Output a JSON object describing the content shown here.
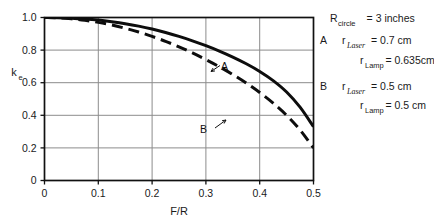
{
  "chart_data": {
    "type": "line",
    "title": "",
    "xlabel": "F/R",
    "ylabel": "k_e",
    "ylabel_base": "k",
    "ylabel_sub": "e",
    "xlim": [
      0,
      0.5
    ],
    "ylim": [
      0,
      1.0
    ],
    "grid": true,
    "xticks": [
      "0",
      "0.1",
      "0.2",
      "0.3",
      "0.4",
      "0.5"
    ],
    "xtick_values": [
      0,
      0.1,
      0.2,
      0.3,
      0.4,
      0.5
    ],
    "yticks": [
      "0",
      "0.2",
      "0.4",
      "0.6",
      "0.8",
      "1.0"
    ],
    "ytick_values": [
      0,
      0.2,
      0.4,
      0.6,
      0.8,
      1.0
    ],
    "legend_position": "right-outside",
    "series": [
      {
        "name": "A",
        "style": "solid",
        "annotation": "A",
        "x": [
          0.0,
          0.025,
          0.05,
          0.075,
          0.1,
          0.125,
          0.15,
          0.175,
          0.2,
          0.225,
          0.25,
          0.275,
          0.3,
          0.325,
          0.35,
          0.375,
          0.4,
          0.425,
          0.45,
          0.475,
          0.5
        ],
        "values": [
          1.0,
          0.999,
          0.996,
          0.991,
          0.984,
          0.974,
          0.962,
          0.947,
          0.929,
          0.908,
          0.884,
          0.857,
          0.827,
          0.794,
          0.757,
          0.716,
          0.669,
          0.613,
          0.543,
          0.45,
          0.33
        ]
      },
      {
        "name": "B",
        "style": "dashed",
        "annotation": "B",
        "x": [
          0.0,
          0.025,
          0.05,
          0.075,
          0.1,
          0.125,
          0.15,
          0.175,
          0.2,
          0.225,
          0.25,
          0.275,
          0.3,
          0.325,
          0.35,
          0.375,
          0.4,
          0.425,
          0.45,
          0.475,
          0.5
        ],
        "values": [
          1.0,
          0.998,
          0.992,
          0.983,
          0.97,
          0.954,
          0.934,
          0.911,
          0.884,
          0.854,
          0.82,
          0.783,
          0.742,
          0.698,
          0.65,
          0.598,
          0.54,
          0.475,
          0.4,
          0.31,
          0.2
        ]
      }
    ],
    "annotations": [
      {
        "text": "A",
        "x": 0.352,
        "y": 0.735
      },
      {
        "text": "B",
        "x": 0.305,
        "y": 0.385
      }
    ]
  },
  "legend": {
    "lines": [
      {
        "base": "R",
        "sub": "circle",
        "sub_italic": false,
        "value": "= 3 inches",
        "indent": 0,
        "prefix": ""
      },
      {
        "base": "r",
        "sub": "Laser",
        "sub_italic": true,
        "value": "= 0.7 cm",
        "indent": 1,
        "prefix": "A"
      },
      {
        "base": "r",
        "sub": "Lamp",
        "sub_italic": false,
        "value": "= 0.635cm",
        "indent": 2,
        "prefix": ""
      },
      {
        "base": "r",
        "sub": "Laser",
        "sub_italic": true,
        "value": "= 0.5 cm",
        "indent": 1,
        "prefix": "B"
      },
      {
        "base": "r",
        "sub": "Lamp",
        "sub_italic": false,
        "value": "= 0.5 cm",
        "indent": 2,
        "prefix": ""
      }
    ]
  },
  "colors": {
    "curve": "#0d0d0d",
    "frame": "#111111",
    "grid": "#8c8c8c",
    "text": "#1a1a1a",
    "background": "#ffffff"
  }
}
